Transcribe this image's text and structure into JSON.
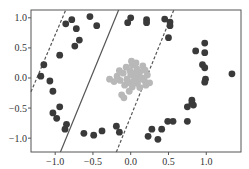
{
  "chart_data": {
    "type": "scatter",
    "title": "",
    "xlabel": "",
    "ylabel": "",
    "xlim": [
      -1.32,
      1.46
    ],
    "ylim": [
      -1.23,
      1.13
    ],
    "grid": false,
    "legend": null,
    "xticks": [
      -1.0,
      -0.5,
      0.0,
      0.5,
      1.0
    ],
    "xtick_labels": [
      "−1.0",
      "−0.5",
      "0.0",
      "0.5",
      "1.0"
    ],
    "yticks": [
      1.0,
      0.5,
      0.0,
      -0.5,
      -1.0
    ],
    "ytick_labels": [
      "1.0",
      "0.5",
      "0.0",
      "−0.5",
      "−1.0"
    ],
    "series": [
      {
        "name": "outer ring",
        "color": "#3a3a3a",
        "points": [
          [
            -0.86,
            0.9
          ],
          [
            -0.78,
            0.97
          ],
          [
            -0.72,
            0.82
          ],
          [
            -0.74,
            0.53
          ],
          [
            -0.68,
            0.63
          ],
          [
            -0.54,
            1.02
          ],
          [
            -0.45,
            0.87
          ],
          [
            -0.94,
            0.38
          ],
          [
            -1.15,
            0.22
          ],
          [
            -1.19,
            0.03
          ],
          [
            -1.07,
            -0.05
          ],
          [
            -1.03,
            -0.22
          ],
          [
            -0.94,
            -0.48
          ],
          [
            -1.03,
            -0.58
          ],
          [
            -0.98,
            -0.67
          ],
          [
            -0.85,
            -0.77
          ],
          [
            -0.87,
            -0.85
          ],
          [
            -0.62,
            -0.92
          ],
          [
            -0.49,
            -0.95
          ],
          [
            -0.38,
            -0.88
          ],
          [
            -0.19,
            -0.8
          ],
          [
            -0.15,
            -0.9
          ],
          [
            0.23,
            -0.97
          ],
          [
            0.28,
            -0.85
          ],
          [
            0.36,
            -1.02
          ],
          [
            0.41,
            -0.85
          ],
          [
            0.49,
            -0.72
          ],
          [
            0.56,
            -0.72
          ],
          [
            0.75,
            -0.48
          ],
          [
            0.75,
            -0.72
          ],
          [
            0.81,
            -0.42
          ],
          [
            0.83,
            -0.45
          ],
          [
            0.0,
            1.0
          ],
          [
            -0.04,
            0.92
          ],
          [
            0.21,
            0.97
          ],
          [
            0.21,
            0.92
          ],
          [
            0.45,
            0.98
          ],
          [
            0.52,
            0.93
          ],
          [
            0.52,
            0.87
          ],
          [
            0.5,
            0.67
          ],
          [
            0.86,
            0.45
          ],
          [
            0.98,
            0.58
          ],
          [
            0.98,
            0.42
          ],
          [
            0.95,
            0.22
          ],
          [
            0.98,
            0.17
          ],
          [
            0.99,
            -0.02
          ],
          [
            0.98,
            -0.07
          ],
          [
            1.34,
            0.07
          ],
          [
            0.81,
            -0.37
          ]
        ]
      },
      {
        "name": "inner cluster",
        "color": "#b8b8b8",
        "points": [
          [
            -0.06,
            0.18
          ],
          [
            0.02,
            0.22
          ],
          [
            0.08,
            0.15
          ],
          [
            0.12,
            0.1
          ],
          [
            -0.1,
            0.08
          ],
          [
            0.0,
            0.05
          ],
          [
            0.05,
            0.02
          ],
          [
            0.1,
            0.04
          ],
          [
            0.15,
            0.0
          ],
          [
            -0.18,
            0.03
          ],
          [
            -0.14,
            -0.04
          ],
          [
            -0.05,
            -0.02
          ],
          [
            0.03,
            -0.06
          ],
          [
            0.09,
            -0.09
          ],
          [
            0.18,
            -0.04
          ],
          [
            0.22,
            0.05
          ],
          [
            -0.22,
            -0.06
          ],
          [
            -0.28,
            -0.02
          ],
          [
            -0.08,
            -0.12
          ],
          [
            0.02,
            -0.15
          ],
          [
            0.12,
            -0.16
          ],
          [
            0.2,
            -0.12
          ],
          [
            -0.02,
            -0.22
          ],
          [
            -0.12,
            -0.28
          ],
          [
            0.07,
            0.25
          ],
          [
            0.16,
            0.2
          ],
          [
            -0.01,
            0.12
          ],
          [
            0.11,
            -0.02
          ],
          [
            0.06,
            0.08
          ],
          [
            -0.04,
            -0.08
          ],
          [
            0.25,
            -0.08
          ],
          [
            -0.09,
            -0.33
          ],
          [
            0.01,
            0.28
          ],
          [
            0.19,
            0.13
          ],
          [
            -0.15,
            0.12
          ]
        ]
      }
    ],
    "lines": [
      {
        "name": "decision boundary",
        "style": "solid",
        "from": [
          -0.93,
          -1.23
        ],
        "to": [
          -0.16,
          1.13
        ]
      },
      {
        "name": "margin left",
        "style": "dashed",
        "from": [
          -1.32,
          -0.23
        ],
        "to": [
          -0.86,
          1.13
        ]
      },
      {
        "name": "margin right",
        "style": "dashed",
        "from": [
          -0.19,
          -1.23
        ],
        "to": [
          0.57,
          1.13
        ]
      }
    ]
  }
}
